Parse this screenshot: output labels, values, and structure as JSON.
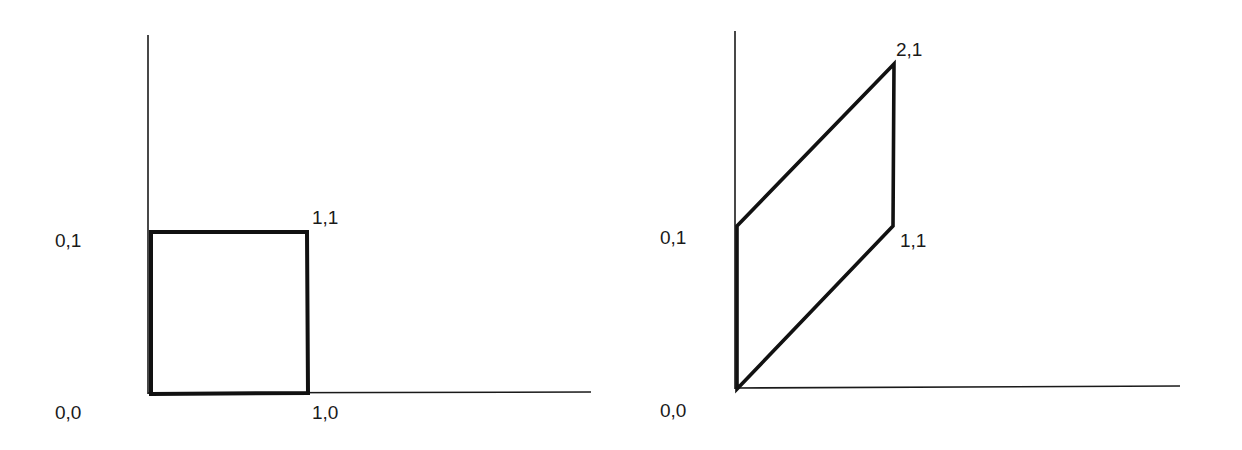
{
  "diagram": {
    "colors": {
      "axis": "#1a1a1a",
      "shape": "#111111",
      "background": "#ffffff"
    },
    "panels": [
      {
        "name": "original",
        "shape": "unit-square",
        "vertices": [
          [
            0,
            0
          ],
          [
            1,
            0
          ],
          [
            1,
            1
          ],
          [
            0,
            1
          ]
        ],
        "labels": {
          "origin": "0,0",
          "x_unit": "1,0",
          "y_unit": "0,1",
          "corner": "1,1"
        }
      },
      {
        "name": "transformed",
        "shape": "parallelogram",
        "vertices": [
          [
            0,
            0
          ],
          [
            1,
            1
          ],
          [
            2,
            1
          ],
          [
            0,
            1
          ]
        ],
        "labels": {
          "origin": "0,0",
          "y_unit": "0,1",
          "b_vertex": "1,1",
          "top_vertex": "2,1"
        }
      }
    ]
  }
}
